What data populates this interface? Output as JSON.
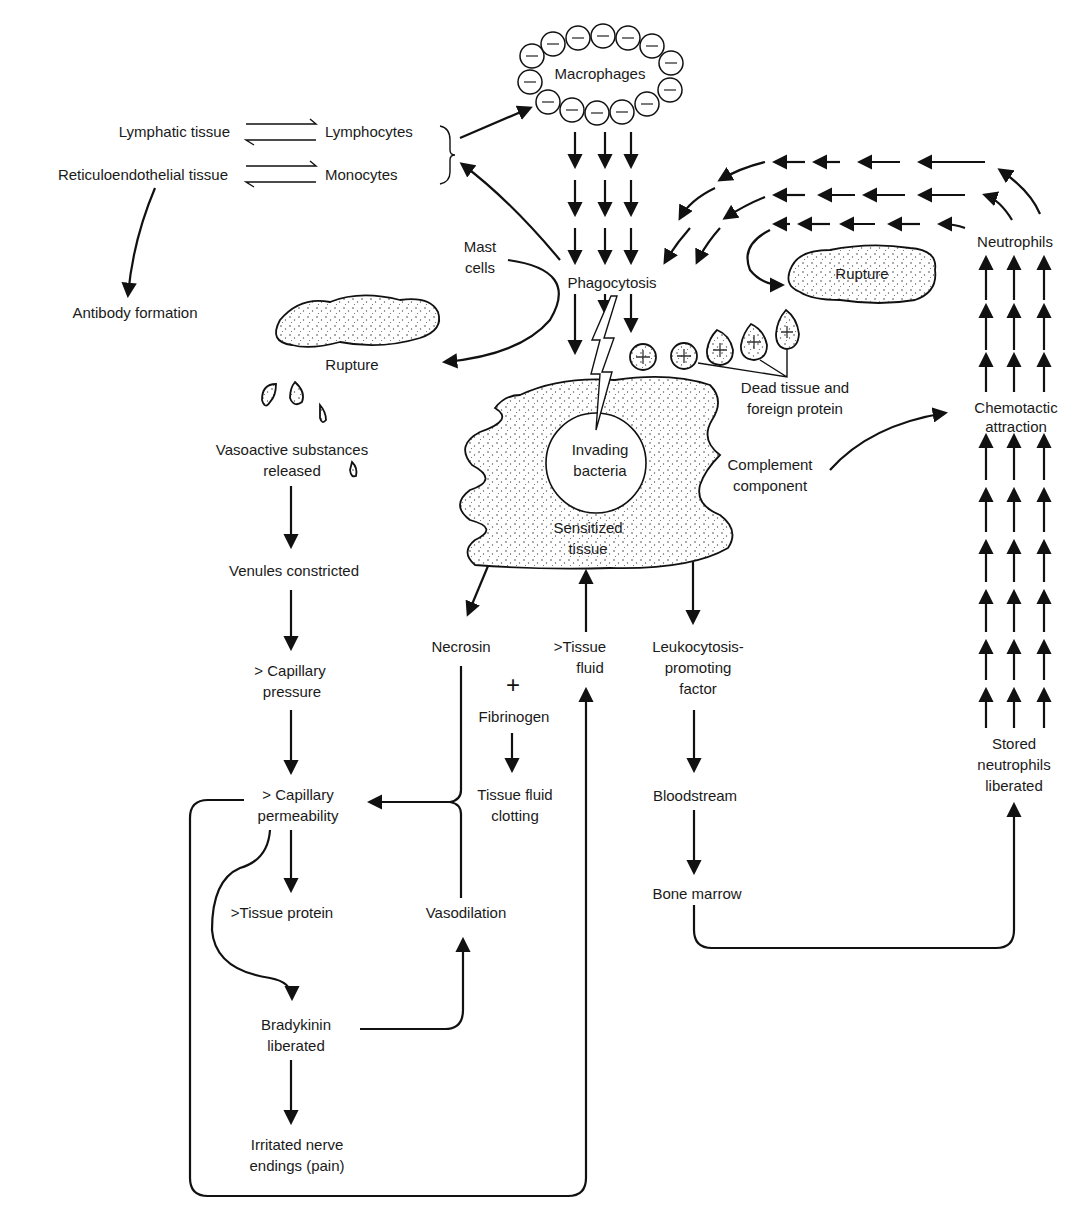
{
  "diagram": {
    "nodes": {
      "lymphatic_tissue": "Lymphatic tissue",
      "reticuloendothelial_tissue": "Reticuloendothelial tissue",
      "lymphocytes": "Lymphocytes",
      "monocytes": "Monocytes",
      "antibody_formation": "Antibody formation",
      "macrophages": "Macrophages",
      "mast_cells_1": "Mast",
      "mast_cells_2": "cells",
      "phagocytosis": "Phagocytosis",
      "rupture_left": "Rupture",
      "rupture_right": "Rupture",
      "neutrophils": "Neutrophils",
      "dead_tissue_1": "Dead tissue and",
      "dead_tissue_2": "foreign protein",
      "chemotactic_1": "Chemotactic",
      "chemotactic_2": "attraction",
      "invading_bacteria_1": "Invading",
      "invading_bacteria_2": "bacteria",
      "sensitized_tissue_1": "Sensitized",
      "sensitized_tissue_2": "tissue",
      "complement_1": "Complement",
      "complement_2": "component",
      "vasoactive_1": "Vasoactive substances",
      "vasoactive_2": "released",
      "venules_constricted": "Venules constricted",
      "capillary_pressure_1": "> Capillary",
      "capillary_pressure_2": "pressure",
      "capillary_permeability_1": "> Capillary",
      "capillary_permeability_2": "permeability",
      "tissue_protein": ">Tissue protein",
      "bradykinin_1": "Bradykinin",
      "bradykinin_2": "liberated",
      "irritated_1": "Irritated nerve",
      "irritated_2": "endings (pain)",
      "necrosin": "Necrosin",
      "plus": "+",
      "fibrinogen": "Fibrinogen",
      "tissue_fluid_clotting_1": "Tissue fluid",
      "tissue_fluid_clotting_2": "clotting",
      "vasodilation": "Vasodilation",
      "tissue_fluid_1": ">Tissue",
      "tissue_fluid_2": "fluid",
      "leukocytosis_1": "Leukocytosis-",
      "leukocytosis_2": "promoting",
      "leukocytosis_3": "factor",
      "bloodstream": "Bloodstream",
      "bone_marrow": "Bone marrow",
      "stored_neutrophils_1": "Stored",
      "stored_neutrophils_2": "neutrophils",
      "stored_neutrophils_3": "liberated"
    },
    "symbols": {
      "macrophage_cell_sign": "−",
      "protein_cell_sign": "+"
    },
    "colors": {
      "ink": "#111111",
      "background": "#ffffff"
    }
  }
}
